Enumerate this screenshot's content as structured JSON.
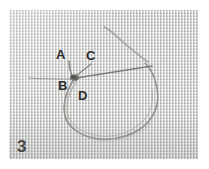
{
  "figure": {
    "number": "3",
    "caption_labels": {
      "a": "A",
      "b": "B",
      "c": "C",
      "d": "D"
    },
    "colors": {
      "fabric": "#d6d6d4",
      "thread": "#8a8a88",
      "label_text": "#2d2d2d",
      "figure_number_text": "#4a4a4a",
      "page_background": "#ffffff"
    }
  },
  "annotations": [
    {
      "id": "a",
      "label": "A",
      "x": 56,
      "y": 48
    },
    {
      "id": "b",
      "label": "B",
      "x": 58,
      "y": 79
    },
    {
      "id": "c",
      "label": "C",
      "x": 86,
      "y": 49
    },
    {
      "id": "d",
      "label": "D",
      "x": 78,
      "y": 89
    }
  ]
}
